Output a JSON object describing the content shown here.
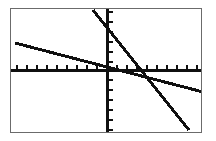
{
  "app": {
    "name": "graphing-calculator-screen",
    "screen_width": 216,
    "screen_height": 141,
    "frame_color": "#6b6b6b",
    "background_color": "#ffffff",
    "ink_color": "#101010"
  },
  "chart_data": {
    "type": "line",
    "title": "",
    "subtitle": "",
    "xlabel": "",
    "ylabel": "",
    "grid": false,
    "legend": null,
    "legend_position": "none",
    "axis_style": {
      "axes_drawn": [
        "x",
        "y"
      ],
      "tick_marks": true,
      "tick_labels": false,
      "tick_spacing_x": 1,
      "tick_spacing_y": 1,
      "x_axis_pixel_y": 69,
      "y_axis_pixel_x": 106,
      "tick_pixel_spacing": 10,
      "tick_pixel_length": 5
    },
    "viewport": {
      "xmin": -10,
      "xmax": 10,
      "ymin": -6.2,
      "ymax": 6.2,
      "xscl": 1,
      "yscl": 1
    },
    "xlim": [
      -10,
      10
    ],
    "ylim": [
      -6.2,
      6.2
    ],
    "series": [
      {
        "name": "Y1",
        "label": "shallow decreasing line",
        "kind": "line",
        "style": "solid",
        "color": "#101010",
        "slope": -0.26,
        "intercept": -0.3,
        "points": [
          {
            "x": -9.6,
            "y": 2.7
          },
          {
            "x": 10.0,
            "y": -2.2
          }
        ],
        "pixel_points": [
          {
            "x": 14,
            "y": 42
          },
          {
            "x": 202,
            "y": 91
          }
        ]
      },
      {
        "name": "Y2",
        "label": "steep decreasing line",
        "kind": "line",
        "style": "solid",
        "color": "#101010",
        "slope": -1.25,
        "intercept": 1.75,
        "points": [
          {
            "x": -1.5,
            "y": 3.0
          },
          {
            "x": 8.5,
            "y": -3.0
          }
        ],
        "pixel_points": [
          {
            "x": 92,
            "y": 9
          },
          {
            "x": 188,
            "y": 129
          }
        ]
      }
    ],
    "annotations": [
      {
        "name": "intersection",
        "label": "",
        "x": 2.9,
        "y": -0.15,
        "pixel_x": 134,
        "pixel_y": 72,
        "visible_marker": false
      }
    ]
  }
}
